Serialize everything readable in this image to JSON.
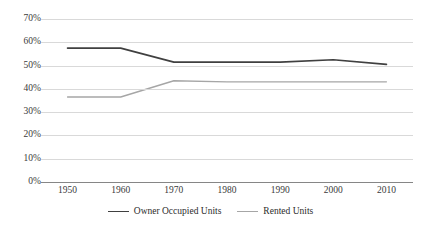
{
  "chart_data": {
    "type": "line",
    "title": "",
    "subtitle": "",
    "xlabel": "",
    "ylabel": "",
    "categories": [
      "1950",
      "1960",
      "1970",
      "1980",
      "1990",
      "2000",
      "2010"
    ],
    "x": [
      1950,
      1960,
      1970,
      1980,
      1990,
      2000,
      2010
    ],
    "ylim": [
      0,
      70
    ],
    "ytick_values": [
      0,
      10,
      20,
      30,
      40,
      50,
      60,
      70
    ],
    "ytick_labels": [
      "0%",
      "10%",
      "20%",
      "30%",
      "40%",
      "50%",
      "60%",
      "70%"
    ],
    "grid": true,
    "legend_position": "bottom",
    "series": [
      {
        "name": "Owner Occupied Units",
        "color": "#404040",
        "values": [
          57.5,
          57.5,
          51.5,
          51.5,
          51.5,
          52.5,
          50.5
        ]
      },
      {
        "name": "Rented Units",
        "color": "#a6a6a6",
        "values": [
          36.5,
          36.5,
          43.5,
          43.0,
          43.0,
          43.0,
          43.0
        ]
      }
    ]
  },
  "colors": {
    "background": "#ffffff",
    "gridline": "#d9d9d9",
    "axis": "#868686",
    "text": "#3a3a3a",
    "series_owner": "#404040",
    "series_rented": "#a6a6a6"
  }
}
